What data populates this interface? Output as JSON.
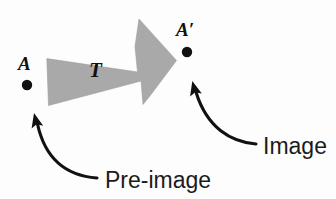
{
  "figure": {
    "background_color": "#fdfdfd",
    "width": 336,
    "height": 199
  },
  "points": {
    "preimage": {
      "label": "A",
      "dot_color": "#111111",
      "x": 27,
      "y": 85
    },
    "image": {
      "label": "A′",
      "dot_color": "#111111",
      "x": 187,
      "y": 52
    }
  },
  "transform_arrow": {
    "label": "T",
    "fill_color": "#a9a9a9",
    "direction": "right-upward"
  },
  "callouts": [
    {
      "id": "preimage-callout",
      "label": "Pre-image",
      "points_to": "A"
    },
    {
      "id": "image-callout",
      "label": "Image",
      "points_to": "A′"
    }
  ]
}
